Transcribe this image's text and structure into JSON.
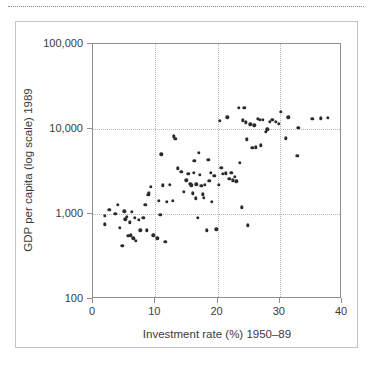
{
  "figure": {
    "top_rule": "dotted-rule",
    "frame": "figure-border"
  },
  "chart_data": {
    "type": "scatter",
    "title": "",
    "xlabel": "Investment rate (%) 1950–89",
    "ylabel": "GDP per capita (log scale) 1989",
    "xlim": [
      0,
      40
    ],
    "ylim": [
      100,
      100000
    ],
    "yscale": "log",
    "xscale": "linear",
    "grid": "dotted gridlines at x = 10, 20, 30 and y = 1,000 and 10,000",
    "legend": "none",
    "xticks": [
      0,
      10,
      20,
      30,
      40
    ],
    "xticklabels": [
      "0",
      "10",
      "20",
      "30",
      "40"
    ],
    "yticks": [
      100,
      1000,
      10000,
      100000
    ],
    "yticklabels": [
      "100",
      "1,000",
      "10,000",
      "100,000"
    ],
    "marker": {
      "shape": "circle",
      "color": "#2b2b2b",
      "size_px": 3.4
    },
    "n_points": 101,
    "points": [
      [
        1.9,
        960
      ],
      [
        1.9,
        760
      ],
      [
        2.6,
        1120
      ],
      [
        3.6,
        1010
      ],
      [
        4.0,
        1280
      ],
      [
        4.3,
        690
      ],
      [
        4.7,
        425
      ],
      [
        5.0,
        1080
      ],
      [
        5.2,
        870
      ],
      [
        5.4,
        930
      ],
      [
        5.7,
        555
      ],
      [
        5.9,
        800
      ],
      [
        6.1,
        560
      ],
      [
        6.2,
        1060
      ],
      [
        6.5,
        520
      ],
      [
        6.7,
        900
      ],
      [
        6.9,
        480
      ],
      [
        7.4,
        860
      ],
      [
        7.6,
        640
      ],
      [
        8.1,
        905
      ],
      [
        8.4,
        1290
      ],
      [
        8.6,
        640
      ],
      [
        8.9,
        1690
      ],
      [
        9.0,
        1760
      ],
      [
        9.3,
        2090
      ],
      [
        9.7,
        560
      ],
      [
        10.3,
        520
      ],
      [
        10.6,
        1430
      ],
      [
        10.8,
        980
      ],
      [
        11.0,
        5050
      ],
      [
        11.2,
        2180
      ],
      [
        11.6,
        470
      ],
      [
        11.9,
        1400
      ],
      [
        12.3,
        2200
      ],
      [
        12.8,
        1430
      ],
      [
        13.0,
        8200
      ],
      [
        13.2,
        7700
      ],
      [
        13.6,
        3450
      ],
      [
        14.2,
        3150
      ],
      [
        14.6,
        1820
      ],
      [
        15.0,
        2480
      ],
      [
        15.3,
        2960
      ],
      [
        15.6,
        2250
      ],
      [
        15.8,
        2180
      ],
      [
        16.0,
        1750
      ],
      [
        16.2,
        3050
      ],
      [
        16.3,
        4200
      ],
      [
        16.5,
        1530
      ],
      [
        16.6,
        2230
      ],
      [
        16.8,
        900
      ],
      [
        17.0,
        5250
      ],
      [
        17.2,
        2880
      ],
      [
        17.4,
        2150
      ],
      [
        17.6,
        1700
      ],
      [
        17.8,
        1560
      ],
      [
        18.0,
        2200
      ],
      [
        18.3,
        640
      ],
      [
        18.5,
        4350
      ],
      [
        18.7,
        2450
      ],
      [
        18.9,
        3050
      ],
      [
        19.1,
        1400
      ],
      [
        19.5,
        2830
      ],
      [
        19.8,
        660
      ],
      [
        20.2,
        2200
      ],
      [
        20.4,
        12400
      ],
      [
        20.6,
        3500
      ],
      [
        20.9,
        2950
      ],
      [
        21.3,
        3000
      ],
      [
        21.6,
        13700
      ],
      [
        21.9,
        2600
      ],
      [
        22.2,
        3050
      ],
      [
        22.5,
        2500
      ],
      [
        22.8,
        2750
      ],
      [
        23.0,
        2420
      ],
      [
        23.4,
        17800
      ],
      [
        23.6,
        4000
      ],
      [
        23.9,
        1200
      ],
      [
        24.1,
        12600
      ],
      [
        24.3,
        17700
      ],
      [
        24.5,
        12000
      ],
      [
        24.7,
        7600
      ],
      [
        24.9,
        740
      ],
      [
        25.3,
        11400
      ],
      [
        25.6,
        6050
      ],
      [
        25.9,
        11100
      ],
      [
        26.2,
        6100
      ],
      [
        26.5,
        13100
      ],
      [
        26.8,
        12900
      ],
      [
        27.0,
        6400
      ],
      [
        27.3,
        12800
      ],
      [
        27.8,
        9200
      ],
      [
        28.0,
        9900
      ],
      [
        28.4,
        12200
      ],
      [
        28.8,
        12900
      ],
      [
        29.4,
        12200
      ],
      [
        29.8,
        11500
      ],
      [
        30.2,
        15900
      ],
      [
        31.0,
        7800
      ],
      [
        31.4,
        13700
      ],
      [
        32.8,
        4800
      ],
      [
        33.0,
        10300
      ],
      [
        35.2,
        13200
      ],
      [
        36.6,
        13300
      ],
      [
        37.7,
        13500
      ]
    ]
  }
}
